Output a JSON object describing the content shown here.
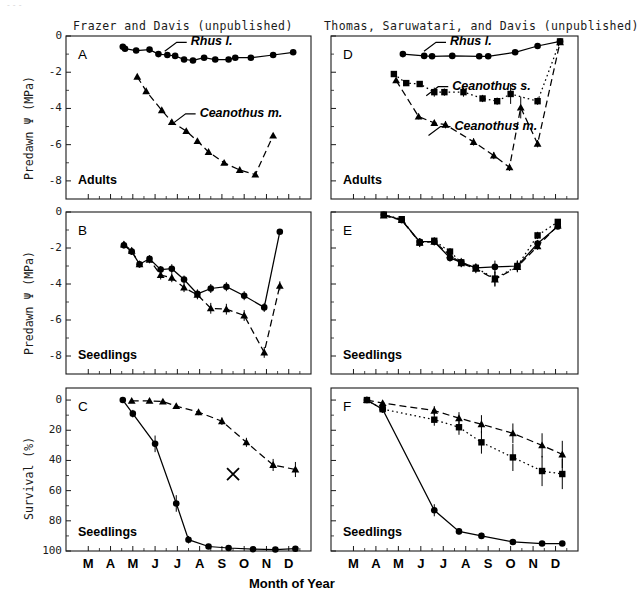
{
  "figure": {
    "artifact_text": "---",
    "x_axis_title": "Month of Year",
    "column_headers": [
      {
        "id": "left",
        "text": "Frazer and Davis (unpublished)"
      },
      {
        "id": "right",
        "text": "Thomas, Saruwatari, and Davis (unpublished)"
      }
    ],
    "month_ticks": [
      "M",
      "A",
      "M",
      "J",
      "J",
      "A",
      "S",
      "O",
      "N",
      "D"
    ],
    "colors": {
      "ink": "#000000",
      "frame": "#1a1a1a",
      "artifact": "#d8d8d8"
    }
  },
  "axes": {
    "psi_label": "Predawn Ψ  (MPa)",
    "psi_ticks": [
      "0",
      "-2",
      "-4",
      "-6",
      "-8"
    ],
    "survival_label": "Survival  (%)",
    "survival_ticks": [
      "100",
      "80",
      "60",
      "40",
      "20",
      "0"
    ]
  },
  "panels": [
    {
      "id": "A",
      "letter": "A",
      "stage": "Adults",
      "row": 0,
      "col": 0
    },
    {
      "id": "B",
      "letter": "B",
      "stage": "Seedlings",
      "row": 1,
      "col": 0
    },
    {
      "id": "C",
      "letter": "C",
      "stage": "Seedlings",
      "row": 2,
      "col": 0
    },
    {
      "id": "D",
      "letter": "D",
      "stage": "Adults",
      "row": 0,
      "col": 1
    },
    {
      "id": "E",
      "letter": "E",
      "stage": "Seedlings",
      "row": 1,
      "col": 1
    },
    {
      "id": "F",
      "letter": "F",
      "stage": "Seedlings",
      "row": 2,
      "col": 1
    }
  ],
  "series_labels": {
    "rhus": "Rhus l.",
    "ceanothus_s": "Ceanothus s.",
    "ceanothus_m": "Ceanothus m."
  },
  "chart_data": [
    {
      "panel": "A",
      "type": "line",
      "title": "A",
      "subtitle": "Adults",
      "xlabel": "Month of Year",
      "ylabel": "Predawn Ψ  (MPa)",
      "xlim": [
        2.0,
        13.0
      ],
      "ylim": [
        -9.0,
        0.0
      ],
      "xticklabels": [
        "M",
        "A",
        "M",
        "J",
        "J",
        "A",
        "S",
        "O",
        "N",
        "D"
      ],
      "yticks": [
        0,
        -2,
        -4,
        -6,
        -8
      ],
      "grid": false,
      "legend": "inline-annotation",
      "annotations": [
        {
          "text": "Rhus l.",
          "x": 7.6,
          "y": -0.35
        },
        {
          "text": "Ceanothus m.",
          "x": 8.0,
          "y": -4.3
        }
      ],
      "series": [
        {
          "name": "Rhus l.",
          "marker": "circle",
          "line": "solid",
          "x": [
            4.55,
            4.65,
            5.15,
            5.75,
            6.15,
            6.55,
            6.9,
            7.3,
            7.7,
            8.2,
            8.7,
            9.3,
            9.6,
            10.3,
            11.3,
            12.2
          ],
          "y": [
            -0.6,
            -0.7,
            -0.8,
            -0.75,
            -1.0,
            -1.05,
            -1.1,
            -1.3,
            -1.35,
            -1.2,
            -1.3,
            -1.3,
            -1.2,
            -1.2,
            -1.05,
            -0.9
          ],
          "yerr": [
            0.12,
            0.12,
            0.1,
            0.1,
            0.1,
            0.1,
            0.1,
            0.1,
            0.1,
            0.1,
            0.1,
            0.1,
            0.1,
            0.1,
            0.1,
            0.1
          ]
        },
        {
          "name": "Ceanothus m.",
          "marker": "triangle",
          "line": "dashed",
          "x": [
            5.2,
            5.6,
            6.3,
            6.75,
            7.4,
            7.9,
            8.4,
            9.1,
            9.8,
            10.5,
            11.3
          ],
          "y": [
            -2.25,
            -3.05,
            -4.1,
            -4.75,
            -5.25,
            -5.8,
            -6.4,
            -7.0,
            -7.4,
            -7.65,
            -5.5
          ],
          "yerr": [
            0.12,
            0.12,
            0.12,
            0.12,
            0.12,
            0.12,
            0.12,
            0.12,
            0.12,
            0.12,
            0.12
          ]
        }
      ]
    },
    {
      "panel": "B",
      "type": "line",
      "title": "B",
      "subtitle": "Seedlings",
      "xlabel": "Month of Year",
      "ylabel": "Predawn Ψ  (MPa)",
      "xlim": [
        2.0,
        13.0
      ],
      "ylim": [
        -9.0,
        0.0
      ],
      "xticklabels": [
        "M",
        "A",
        "M",
        "J",
        "J",
        "A",
        "S",
        "O",
        "N",
        "D"
      ],
      "yticks": [
        0,
        -2,
        -4,
        -6,
        -8
      ],
      "grid": false,
      "series": [
        {
          "name": "Rhus l.",
          "marker": "circle",
          "line": "solid",
          "x": [
            4.6,
            4.95,
            5.3,
            5.75,
            6.25,
            6.75,
            7.3,
            7.9,
            8.5,
            9.2,
            10.0,
            10.9,
            11.6
          ],
          "y": [
            -1.85,
            -2.2,
            -2.9,
            -2.6,
            -3.2,
            -3.15,
            -3.75,
            -4.55,
            -4.25,
            -4.15,
            -4.65,
            -5.3,
            -1.1
          ],
          "yerr": [
            0.18,
            0.18,
            0.18,
            0.2,
            0.2,
            0.25,
            0.22,
            0.25,
            0.25,
            0.25,
            0.25,
            0.25,
            0.1
          ]
        },
        {
          "name": "Ceanothus m.",
          "marker": "triangle",
          "line": "dashed",
          "x": [
            4.6,
            4.95,
            5.3,
            5.75,
            6.25,
            6.75,
            7.3,
            7.9,
            8.5,
            9.2,
            10.0,
            10.9,
            11.6
          ],
          "y": [
            -1.8,
            -2.15,
            -2.9,
            -2.65,
            -3.5,
            -3.65,
            -4.2,
            -4.6,
            -5.35,
            -5.4,
            -5.75,
            -7.8,
            -4.1
          ],
          "yerr": [
            0.18,
            0.18,
            0.18,
            0.2,
            0.25,
            0.25,
            0.25,
            0.25,
            0.3,
            0.3,
            0.3,
            0.3,
            0.25
          ]
        }
      ]
    },
    {
      "panel": "C",
      "type": "line",
      "title": "C",
      "subtitle": "Seedlings",
      "xlabel": "Month of Year",
      "ylabel": "Survival  (%)",
      "xlim": [
        2.0,
        13.0
      ],
      "ylim": [
        0,
        108
      ],
      "xticklabels": [
        "M",
        "A",
        "M",
        "J",
        "J",
        "A",
        "S",
        "O",
        "N",
        "D"
      ],
      "yticks": [
        0,
        20,
        40,
        60,
        80,
        100
      ],
      "grid": false,
      "markers_extra": [
        {
          "symbol": "X",
          "x": 9.5,
          "y": 51
        }
      ],
      "series": [
        {
          "name": "Rhus l.",
          "marker": "circle",
          "line": "solid",
          "x": [
            4.55,
            5.0,
            6.0,
            6.95,
            7.5,
            8.4,
            9.3,
            10.4,
            11.4,
            12.3
          ],
          "y": [
            100,
            91,
            71,
            31.5,
            7.5,
            3,
            2,
            1.2,
            1.0,
            1.5
          ],
          "yerr": [
            0,
            2.5,
            5.5,
            5.5,
            2.5,
            1.5,
            1.0,
            0.8,
            0.6,
            0.6
          ]
        },
        {
          "name": "Ceanothus m.",
          "marker": "triangle",
          "line": "dashed",
          "x": [
            4.95,
            5.75,
            6.35,
            6.95,
            7.95,
            9.0,
            10.1,
            11.3,
            12.3
          ],
          "y": [
            99.5,
            99.5,
            99,
            96,
            92,
            86,
            72,
            57,
            54
          ],
          "yerr": [
            0.5,
            0.5,
            0.8,
            1.5,
            2.0,
            2.5,
            3.0,
            4.0,
            5.0
          ]
        }
      ]
    },
    {
      "panel": "D",
      "type": "line",
      "title": "D",
      "subtitle": "Adults",
      "xlabel": "Month of Year",
      "ylabel": "Predawn Ψ  (MPa)",
      "xlim": [
        2.0,
        13.0
      ],
      "ylim": [
        -9.0,
        0.0
      ],
      "xticklabels": [
        "M",
        "A",
        "M",
        "J",
        "J",
        "A",
        "S",
        "O",
        "N",
        "D"
      ],
      "yticks": [
        0,
        -2,
        -4,
        -6,
        -8
      ],
      "grid": false,
      "legend": "inline-annotation",
      "annotations": [
        {
          "text": "Rhus l.",
          "x": 7.3,
          "y": -0.35
        },
        {
          "text": "Ceanothus s.",
          "x": 7.4,
          "y": -2.8
        },
        {
          "text": "Ceanothus m.",
          "x": 7.5,
          "y": -5.0
        }
      ],
      "series": [
        {
          "name": "Rhus l.",
          "marker": "circle",
          "line": "solid",
          "x": [
            5.2,
            6.15,
            6.5,
            7.4,
            8.6,
            9.0,
            10.2,
            11.2,
            12.2
          ],
          "y": [
            -1.0,
            -1.1,
            -1.12,
            -1.1,
            -1.12,
            -1.12,
            -0.9,
            -0.55,
            -0.3
          ],
          "yerr": [
            0.12,
            0.12,
            0.12,
            0.12,
            0.12,
            0.12,
            0.15,
            0.15,
            0.12
          ]
        },
        {
          "name": "Ceanothus s.",
          "marker": "square",
          "line": "dotted",
          "x": [
            4.8,
            5.35,
            5.95,
            6.6,
            7.05,
            7.9,
            8.75,
            9.4,
            10.0,
            11.2,
            12.2
          ],
          "y": [
            -2.1,
            -2.6,
            -2.65,
            -3.1,
            -3.1,
            -3.1,
            -3.45,
            -3.6,
            -3.2,
            -3.6,
            -0.3
          ],
          "yerr": [
            0.15,
            0.15,
            0.15,
            0.25,
            0.2,
            0.25,
            0.2,
            0.2,
            0.55,
            0.2,
            0.12
          ]
        },
        {
          "name": "Ceanothus m.",
          "marker": "triangle",
          "line": "dashed",
          "x": [
            4.9,
            5.9,
            6.6,
            7.1,
            8.35,
            9.25,
            9.95,
            10.45,
            11.2,
            12.2
          ],
          "y": [
            -2.45,
            -4.45,
            -4.8,
            -4.9,
            -5.85,
            -6.6,
            -7.25,
            -3.95,
            -5.95,
            -0.35
          ],
          "yerr": [
            0.15,
            0.15,
            0.15,
            0.2,
            0.2,
            0.2,
            0.2,
            0.6,
            0.2,
            0.12
          ]
        }
      ]
    },
    {
      "panel": "E",
      "type": "line",
      "title": "E",
      "subtitle": "Seedlings",
      "xlabel": "Month of Year",
      "ylabel": "Predawn Ψ  (MPa)",
      "xlim": [
        2.0,
        13.0
      ],
      "ylim": [
        -9.0,
        0.0
      ],
      "xticklabels": [
        "M",
        "A",
        "M",
        "J",
        "J",
        "A",
        "S",
        "O",
        "N",
        "D"
      ],
      "yticks": [
        0,
        -2,
        -4,
        -6,
        -8
      ],
      "grid": false,
      "series": [
        {
          "name": "Rhus l.",
          "marker": "circle",
          "line": "solid",
          "x": [
            4.35,
            5.15,
            5.95,
            6.6,
            7.3,
            7.8,
            8.45,
            9.3,
            10.3,
            11.2,
            12.1
          ],
          "y": [
            -0.15,
            -0.45,
            -1.65,
            -1.65,
            -2.55,
            -2.8,
            -3.1,
            -3.05,
            -3.0,
            -1.75,
            -0.8
          ],
          "yerr": [
            0.1,
            0.1,
            0.2,
            0.2,
            0.2,
            0.2,
            0.2,
            0.35,
            0.3,
            0.2,
            0.15
          ]
        },
        {
          "name": "Ceanothus s.",
          "marker": "square",
          "line": "dotted",
          "x": [
            4.35,
            5.15,
            5.95,
            6.6,
            7.3,
            7.8,
            8.45,
            9.3,
            10.3,
            11.2,
            12.1
          ],
          "y": [
            -0.15,
            -0.4,
            -1.7,
            -1.6,
            -2.2,
            -2.8,
            -3.1,
            -3.7,
            -3.0,
            -1.3,
            -0.55
          ],
          "yerr": [
            0.1,
            0.1,
            0.25,
            0.2,
            0.2,
            0.25,
            0.25,
            0.4,
            0.3,
            0.2,
            0.15
          ]
        },
        {
          "name": "Ceanothus m.",
          "marker": "triangle",
          "line": "dashed",
          "x": [
            4.35,
            5.15,
            5.95,
            6.6,
            7.3,
            7.8,
            8.45,
            9.3,
            10.3,
            11.2,
            12.1
          ],
          "y": [
            -0.2,
            -0.45,
            -1.7,
            -1.65,
            -2.4,
            -2.85,
            -3.15,
            -3.75,
            -3.05,
            -1.9,
            -0.75
          ],
          "yerr": [
            0.1,
            0.1,
            0.22,
            0.2,
            0.2,
            0.22,
            0.25,
            0.4,
            0.3,
            0.2,
            0.15
          ]
        }
      ]
    },
    {
      "panel": "F",
      "type": "line",
      "title": "F",
      "subtitle": "Seedlings",
      "xlabel": "Month of Year",
      "ylabel": "Survival  (%)",
      "xlim": [
        2.0,
        13.0
      ],
      "ylim": [
        0,
        108
      ],
      "xticklabels": [
        "M",
        "A",
        "M",
        "J",
        "J",
        "A",
        "S",
        "O",
        "N",
        "D"
      ],
      "yticks": [
        0,
        20,
        40,
        60,
        80,
        100
      ],
      "grid": false,
      "series": [
        {
          "name": "Rhus l.",
          "marker": "circle",
          "line": "solid",
          "x": [
            3.6,
            4.3,
            6.6,
            7.7,
            8.7,
            10.1,
            11.4,
            12.3
          ],
          "y": [
            100,
            94,
            27,
            13,
            10,
            6,
            5,
            5
          ],
          "yerr": [
            1.5,
            2.0,
            4.0,
            2.0,
            2.0,
            1.5,
            1.0,
            1.0
          ]
        },
        {
          "name": "Ceanothus s.",
          "marker": "square",
          "line": "dotted",
          "x": [
            3.6,
            4.3,
            6.6,
            7.7,
            8.7,
            10.1,
            11.4,
            12.3
          ],
          "y": [
            100,
            94,
            87,
            82,
            72,
            62,
            53,
            51
          ],
          "yerr": [
            1.5,
            2.5,
            4.0,
            5.0,
            7.5,
            9.0,
            10.0,
            10.0
          ]
        },
        {
          "name": "Ceanothus m.",
          "marker": "triangle",
          "line": "dashed",
          "x": [
            3.6,
            4.3,
            6.6,
            7.7,
            8.7,
            10.1,
            11.4,
            12.3
          ],
          "y": [
            100,
            98,
            93,
            88,
            84,
            78,
            70,
            64
          ],
          "yerr": [
            1.5,
            1.5,
            3.0,
            4.0,
            6.0,
            6.5,
            8.0,
            9.0
          ]
        }
      ]
    }
  ]
}
